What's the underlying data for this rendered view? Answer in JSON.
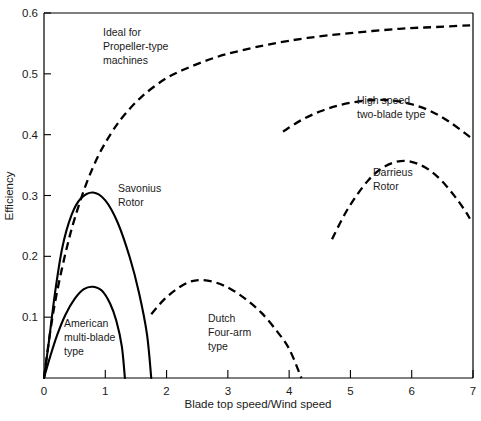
{
  "chart_data": {
    "type": "line",
    "title": "",
    "xlabel": "Blade top speed/Wind speed",
    "ylabel": "Efficiency",
    "xlim": [
      0,
      7
    ],
    "ylim": [
      0,
      0.6
    ],
    "grid": false,
    "legend": "none (curves labeled inline)",
    "xticks": [
      "0",
      "1",
      "2",
      "3",
      "4",
      "5",
      "6",
      "7"
    ],
    "xtick_values": [
      0,
      1,
      2,
      3,
      4,
      5,
      6,
      7
    ],
    "yticks": [
      "0.1",
      "0.2",
      "0.3",
      "0.4",
      "0.5",
      "0.6"
    ],
    "ytick_values": [
      0.1,
      0.2,
      0.3,
      0.4,
      0.5,
      0.6
    ],
    "series": [
      {
        "name": "Ideal for Propeller-type machines",
        "style": "dashed",
        "label_lines": [
          "Ideal for",
          "Propeller-type",
          "machines"
        ],
        "points": [
          [
            0.0,
            0.0
          ],
          [
            0.1,
            0.075
          ],
          [
            0.2,
            0.135
          ],
          [
            0.35,
            0.205
          ],
          [
            0.5,
            0.262
          ],
          [
            0.7,
            0.322
          ],
          [
            0.9,
            0.368
          ],
          [
            1.1,
            0.403
          ],
          [
            1.3,
            0.431
          ],
          [
            1.6,
            0.463
          ],
          [
            2.0,
            0.493
          ],
          [
            2.4,
            0.512
          ],
          [
            2.8,
            0.527
          ],
          [
            3.2,
            0.538
          ],
          [
            3.7,
            0.549
          ],
          [
            4.3,
            0.559
          ],
          [
            5.0,
            0.567
          ],
          [
            5.8,
            0.574
          ],
          [
            6.4,
            0.577
          ],
          [
            7.0,
            0.58
          ]
        ]
      },
      {
        "name": "Savonius Rotor",
        "style": "solid",
        "label_lines": [
          "Savonius",
          "Rotor"
        ],
        "points": [
          [
            0.0,
            0.0
          ],
          [
            0.08,
            0.06
          ],
          [
            0.18,
            0.14
          ],
          [
            0.3,
            0.215
          ],
          [
            0.45,
            0.268
          ],
          [
            0.6,
            0.295
          ],
          [
            0.8,
            0.305
          ],
          [
            1.0,
            0.292
          ],
          [
            1.2,
            0.256
          ],
          [
            1.4,
            0.198
          ],
          [
            1.55,
            0.14
          ],
          [
            1.68,
            0.072
          ],
          [
            1.75,
            0.0
          ]
        ]
      },
      {
        "name": "American multi-blade type",
        "style": "solid",
        "label_lines": [
          "American",
          "multi-blade",
          "type"
        ],
        "points": [
          [
            0.0,
            0.0
          ],
          [
            0.1,
            0.035
          ],
          [
            0.22,
            0.072
          ],
          [
            0.35,
            0.104
          ],
          [
            0.5,
            0.13
          ],
          [
            0.65,
            0.146
          ],
          [
            0.8,
            0.15
          ],
          [
            0.95,
            0.143
          ],
          [
            1.08,
            0.122
          ],
          [
            1.18,
            0.094
          ],
          [
            1.27,
            0.052
          ],
          [
            1.32,
            0.0
          ]
        ]
      },
      {
        "name": "Dutch Four-arm type",
        "style": "dashed",
        "label_lines": [
          "Dutch",
          "Four-arm",
          "type"
        ],
        "points": [
          [
            1.75,
            0.105
          ],
          [
            1.95,
            0.128
          ],
          [
            2.15,
            0.145
          ],
          [
            2.35,
            0.157
          ],
          [
            2.55,
            0.161
          ],
          [
            2.8,
            0.157
          ],
          [
            3.05,
            0.146
          ],
          [
            3.3,
            0.129
          ],
          [
            3.55,
            0.107
          ],
          [
            3.8,
            0.077
          ],
          [
            4.0,
            0.048
          ],
          [
            4.2,
            0.0
          ]
        ]
      },
      {
        "name": "High speed two-blade type",
        "style": "dashed",
        "label_lines": [
          "High speed",
          "two-blade type"
        ],
        "points": [
          [
            3.9,
            0.405
          ],
          [
            4.2,
            0.424
          ],
          [
            4.5,
            0.438
          ],
          [
            4.8,
            0.448
          ],
          [
            5.1,
            0.454
          ],
          [
            5.4,
            0.457
          ],
          [
            5.7,
            0.456
          ],
          [
            6.0,
            0.45
          ],
          [
            6.3,
            0.439
          ],
          [
            6.6,
            0.422
          ],
          [
            6.9,
            0.4
          ],
          [
            7.0,
            0.392
          ]
        ]
      },
      {
        "name": "Darrieus Rotor",
        "style": "dashed",
        "label_lines": [
          "Darrieus",
          "Rotor"
        ],
        "points": [
          [
            4.7,
            0.228
          ],
          [
            4.9,
            0.268
          ],
          [
            5.1,
            0.3
          ],
          [
            5.3,
            0.326
          ],
          [
            5.5,
            0.344
          ],
          [
            5.7,
            0.354
          ],
          [
            5.9,
            0.357
          ],
          [
            6.1,
            0.352
          ],
          [
            6.3,
            0.341
          ],
          [
            6.5,
            0.323
          ],
          [
            6.7,
            0.299
          ],
          [
            6.85,
            0.278
          ],
          [
            6.95,
            0.262
          ]
        ]
      }
    ],
    "annotations": [
      {
        "name": "ideal-propeller-label",
        "lines": [
          "Ideal for",
          "Propeller-type",
          "machines"
        ],
        "x": 1.0,
        "y": 0.545
      },
      {
        "name": "savonius-rotor-label",
        "lines": [
          "Savonius",
          "Rotor"
        ],
        "x": 1.22,
        "y": 0.307
      },
      {
        "name": "american-multiblade-label",
        "lines": [
          "American",
          "multi-blade",
          "type"
        ],
        "x": 0.27,
        "y": 0.098
      },
      {
        "name": "dutch-fourarm-label",
        "lines": [
          "Dutch",
          "Four-arm",
          "type"
        ],
        "x": 2.62,
        "y": 0.107
      },
      {
        "name": "high-speed-twoblade-label",
        "lines": [
          "High speed",
          "two-blade type"
        ],
        "x": 5.35,
        "y": 0.452
      },
      {
        "name": "darrieus-rotor-label",
        "lines": [
          "Darrieus",
          "Rotor"
        ],
        "x": 5.62,
        "y": 0.348
      }
    ]
  },
  "axes": {
    "x_title": "Blade top speed/Wind speed",
    "y_title": "Efficiency",
    "x_tick_labels": [
      "0",
      "1",
      "2",
      "3",
      "4",
      "5",
      "6",
      "7"
    ],
    "y_tick_labels": [
      "0.1",
      "0.2",
      "0.3",
      "0.4",
      "0.5",
      "0.6"
    ]
  },
  "annotation_text": {
    "ideal_1": "Ideal for",
    "ideal_2": "Propeller-type",
    "ideal_3": "machines",
    "savonius_1": "Savonius",
    "savonius_2": "Rotor",
    "american_1": "American",
    "american_2": "multi-blade",
    "american_3": "type",
    "dutch_1": "Dutch",
    "dutch_2": "Four-arm",
    "dutch_3": "type",
    "highspeed_1": "High speed",
    "highspeed_2": "two-blade type",
    "darrieus_1": "Darrieus",
    "darrieus_2": "Rotor"
  },
  "colors": {
    "ink": "#000000",
    "background": "#ffffff",
    "text": "#1a1a1a"
  }
}
